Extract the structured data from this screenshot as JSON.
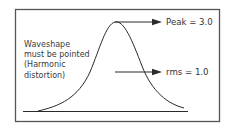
{
  "diagram": {
    "note_lines": [
      "Waveshape",
      "must be pointed",
      "(Harmonic",
      "distortion)"
    ],
    "peak_label": "Peak = 3.0",
    "rms_label": "rms = 1.0",
    "colors": {
      "line": "#2a2a2a",
      "frame": "#555555",
      "text": "#333333",
      "background": "#ffffff"
    }
  }
}
